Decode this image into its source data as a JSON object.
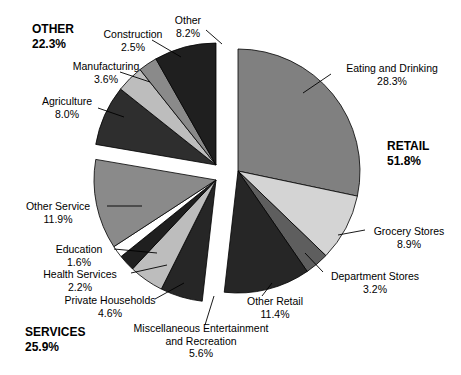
{
  "chart_data": {
    "type": "pie",
    "title": "",
    "subtitle": "",
    "xlabel": "",
    "ylabel": "",
    "legend_position": "none",
    "grid": false,
    "units": "percent",
    "total": 100.0,
    "exploded": true,
    "groups": [
      {
        "key": "retail",
        "label": "RETAIL",
        "percent_label": "51.8%",
        "value": 51.8,
        "slices": [
          {
            "key": "eating-and-drinking",
            "label": "Eating and Drinking",
            "percent_label": "28.3%",
            "value": 28.3,
            "color": "#808080"
          },
          {
            "key": "grocery-stores",
            "label": "Grocery Stores",
            "percent_label": "8.9%",
            "value": 8.9,
            "color": "#d4d4d4"
          },
          {
            "key": "department-stores",
            "label": "Department Stores",
            "percent_label": "3.2%",
            "value": 3.2,
            "color": "#5e5e5e"
          },
          {
            "key": "other-retail",
            "label": "Other Retail",
            "percent_label": "11.4%",
            "value": 11.4,
            "color": "#262626"
          }
        ]
      },
      {
        "key": "services",
        "label": "SERVICES",
        "percent_label": "25.9%",
        "value": 25.9,
        "slices": [
          {
            "key": "miscellaneous-entertainment-and-recreation",
            "label": "Miscellaneous Entertainment and Recreation",
            "label_line1": "Miscellaneous Entertainment",
            "label_line2": "and Recreation",
            "percent_label": "5.6%",
            "value": 5.6,
            "color": "#262626"
          },
          {
            "key": "private-households",
            "label": "Private Households",
            "percent_label": "4.6%",
            "value": 4.6,
            "color": "#bdbdbd"
          },
          {
            "key": "health-services",
            "label": "Health Services",
            "percent_label": "2.2%",
            "value": 2.2,
            "color": "#1f1f1f"
          },
          {
            "key": "education",
            "label": "Education",
            "percent_label": "1.6%",
            "value": 1.6,
            "color": "#ffffff"
          },
          {
            "key": "other-service",
            "label": "Other Service",
            "percent_label": "11.9%",
            "value": 11.9,
            "color": "#8a8a8a"
          }
        ]
      },
      {
        "key": "other",
        "label": "OTHER",
        "percent_label": "22.3%",
        "value": 22.3,
        "slices": [
          {
            "key": "agriculture",
            "label": "Agriculture",
            "percent_label": "8.0%",
            "value": 8.0,
            "color": "#2e2e2e"
          },
          {
            "key": "manufacturing",
            "label": "Manufacturing",
            "percent_label": "3.6%",
            "value": 3.6,
            "color": "#bdbdbd"
          },
          {
            "key": "construction",
            "label": "Construction",
            "percent_label": "2.5%",
            "value": 2.5,
            "color": "#8a8a8a"
          },
          {
            "key": "other-sector",
            "label": "Other",
            "percent_label": "8.2%",
            "value": 8.2,
            "color": "#1f1f1f"
          }
        ]
      }
    ],
    "palette": {
      "near-black": "#1f1f1f",
      "dark-gray": "#262626",
      "mid-dark-gray": "#5e5e5e",
      "mid-gray": "#808080",
      "light-gray": "#bdbdbd",
      "pale-gray": "#d4d4d4",
      "white": "#ffffff",
      "outline": "#000000",
      "background": "#ffffff"
    }
  },
  "labels": {
    "other_group": {
      "name": "OTHER",
      "pct": "22.3%"
    },
    "retail_group": {
      "name": "RETAIL",
      "pct": "51.8%"
    },
    "services_group": {
      "name": "SERVICES",
      "pct": "25.9%"
    },
    "construction": {
      "name": "Construction",
      "pct": "2.5%"
    },
    "other_sector": {
      "name": "Other",
      "pct": "8.2%"
    },
    "manufacturing": {
      "name": "Manufacturing",
      "pct": "3.6%"
    },
    "agriculture": {
      "name": "Agriculture",
      "pct": "8.0%"
    },
    "eating_and_drinking": {
      "name": "Eating and Drinking",
      "pct": "28.3%"
    },
    "grocery_stores": {
      "name": "Grocery Stores",
      "pct": "8.9%"
    },
    "department_stores": {
      "name": "Department Stores",
      "pct": "3.2%"
    },
    "other_retail": {
      "name": "Other Retail",
      "pct": "11.4%"
    },
    "other_service": {
      "name": "Other Service",
      "pct": "11.9%"
    },
    "education": {
      "name": "Education",
      "pct": "1.6%"
    },
    "health_services": {
      "name": "Health Services",
      "pct": "2.2%"
    },
    "private_households": {
      "name": "Private Households",
      "pct": "4.6%"
    },
    "misc_entertainment": {
      "line1": "Miscellaneous Entertainment",
      "line2": "and Recreation",
      "pct": "5.6%"
    }
  }
}
